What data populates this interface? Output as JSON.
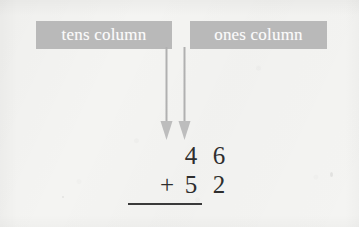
{
  "figure": {
    "kind": "place-value-addition-diagram",
    "background_color": "#f4f4f2",
    "callout_color": "#b9b9b9",
    "callout_text_color": "#fbfbfb",
    "ink_color": "#2e2e2e",
    "arrow_color": "#b0b0b0"
  },
  "callouts": {
    "tens": {
      "label": "tens column",
      "points_to": "tens"
    },
    "ones": {
      "label": "ones column",
      "points_to": "ones"
    }
  },
  "arrows": [
    {
      "name": "tens-arrow",
      "direction": "down"
    },
    {
      "name": "ones-arrow",
      "direction": "down"
    }
  ],
  "sum": {
    "addend_one": {
      "tens": "4",
      "ones": "6"
    },
    "addend_two": {
      "operator": "+",
      "tens": "5",
      "ones": "2"
    },
    "rule": true
  }
}
